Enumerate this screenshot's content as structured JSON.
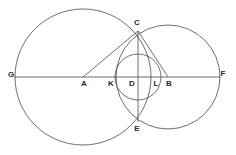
{
  "figure": {
    "background_color": "#ffffff",
    "stroke_color": "#4a4a4a",
    "label_color": "#2a2a2a",
    "stroke_width": 0.8
  },
  "chart_data": {
    "type": "diagram",
    "xlabel": "",
    "ylabel": "",
    "xlim": [
      0,
      236
    ],
    "ylim": [
      0,
      155
    ],
    "grid": false,
    "legend": null,
    "points": [
      {
        "id": "G",
        "label": "G",
        "x": 14,
        "y": 77,
        "label_x": 11,
        "label_y": 75
      },
      {
        "id": "A",
        "label": "A",
        "x": 83,
        "y": 77,
        "label_x": 84,
        "label_y": 84
      },
      {
        "id": "K",
        "label": "K",
        "x": 116,
        "y": 77,
        "label_x": 111,
        "label_y": 84
      },
      {
        "id": "D",
        "label": "D",
        "x": 138,
        "y": 77,
        "label_x": 132,
        "label_y": 84
      },
      {
        "id": "L",
        "label": "L",
        "x": 160,
        "y": 77,
        "label_x": 156,
        "label_y": 84
      },
      {
        "id": "B",
        "label": "B",
        "x": 168,
        "y": 77,
        "label_x": 169,
        "label_y": 84
      },
      {
        "id": "F",
        "label": "F",
        "x": 220,
        "y": 77,
        "label_x": 223,
        "label_y": 74
      },
      {
        "id": "C",
        "label": "C",
        "x": 138,
        "y": 31,
        "label_x": 137,
        "label_y": 23
      },
      {
        "id": "E",
        "label": "E",
        "x": 138,
        "y": 122,
        "label_x": 137,
        "label_y": 129
      }
    ],
    "circles": [
      {
        "id": "circle-A",
        "center_label": "A",
        "cx": 83,
        "cy": 77,
        "r": 68,
        "note": "large left circle through G, C, E"
      },
      {
        "id": "circle-B",
        "center_label": "B",
        "cx": 168,
        "cy": 77,
        "r": 52,
        "note": "right circle through C, E, F"
      },
      {
        "id": "circle-D",
        "center_label": "D",
        "cx": 138,
        "cy": 77,
        "r": 23,
        "note": "small middle circle through K, C, L, E"
      }
    ],
    "segments": [
      {
        "id": "GF",
        "from": "G",
        "to": "F",
        "x1": 14,
        "y1": 77,
        "x2": 220,
        "y2": 77,
        "note": "horizontal diameter line"
      },
      {
        "id": "AC",
        "from": "A",
        "to": "C",
        "x1": 83,
        "y1": 77,
        "x2": 138,
        "y2": 31,
        "note": "radius of circle A to C"
      },
      {
        "id": "CB",
        "from": "C",
        "to": "B",
        "x1": 138,
        "y1": 31,
        "x2": 168,
        "y2": 77,
        "note": "radius of circle B to C"
      },
      {
        "id": "CE",
        "from": "C",
        "to": "E",
        "x1": 138,
        "y1": 31,
        "x2": 138,
        "y2": 122,
        "note": "common chord, vertical through D"
      }
    ]
  }
}
